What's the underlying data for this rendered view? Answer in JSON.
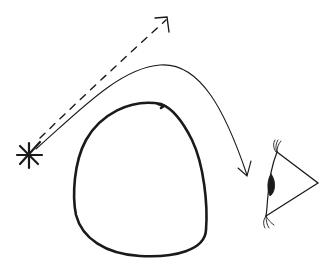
{
  "diagram": {
    "title": "Light path around an occluding object to an observer's eye",
    "background": "#ffffff",
    "ink_color": "#1a1a1a",
    "elements": {
      "light_source": {
        "label": "light-source (asterisk star)",
        "shape": "asterisk",
        "spokes": 8
      },
      "direct_ray": {
        "label": "direct ray (dashed arrow)",
        "style": "dashed",
        "arrowhead": "open"
      },
      "bent_ray": {
        "label": "curved ray (solid arrow bending around object)",
        "style": "solid",
        "arrowhead": "open"
      },
      "occluder": {
        "label": "occluding object (rounded triangular loop)",
        "style": "thick solid outline"
      },
      "observer_eye": {
        "label": "observer eye (side-view triangle with iris and lashes)"
      }
    }
  }
}
